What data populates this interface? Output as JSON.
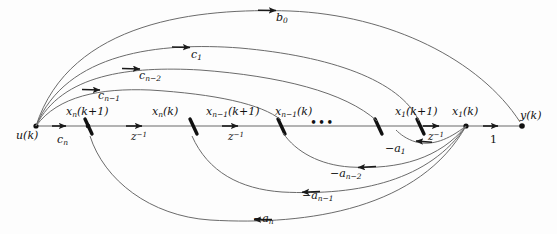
{
  "figure": {
    "type": "signal-flow-graph",
    "width": 557,
    "height": 234,
    "background_color": "#fdfdfd",
    "line_color": "#555555",
    "text_color": "#111111"
  },
  "nodes": [
    {
      "id": "u",
      "label": "u(k)",
      "x": 36,
      "y": 126,
      "label_x": 16,
      "label_y": 130,
      "kind": "input-node"
    },
    {
      "id": "xn_kp1",
      "label": "x<sub>n</sub>(k+1)",
      "x": 88,
      "y": 126,
      "label_x": 66,
      "label_y": 106,
      "kind": "state-node"
    },
    {
      "id": "xn_k",
      "label": "x<sub>n</sub>(k)",
      "x": 193,
      "y": 126,
      "label_x": 152,
      "label_y": 106,
      "kind": "state-node"
    },
    {
      "id": "xnm1_kp1",
      "label": "x<sub>n−1</sub>(k+1)",
      "x": 281,
      "y": 126,
      "label_x": 206,
      "label_y": 106,
      "kind": "state-node"
    },
    {
      "id": "xnm1_k",
      "label": "x<sub>n−1</sub>(k)",
      "x": 378,
      "y": 126,
      "label_x": 275,
      "label_y": 106,
      "kind": "state-node"
    },
    {
      "id": "x1_kp1",
      "label": "x<sub>1</sub>(k+1)",
      "x": 420,
      "y": 126,
      "label_x": 395,
      "label_y": 106,
      "kind": "state-node"
    },
    {
      "id": "x1_k",
      "label": "x<sub>1</sub>(k)",
      "x": 466,
      "y": 126,
      "label_x": 452,
      "label_y": 106,
      "kind": "state-node"
    },
    {
      "id": "y",
      "label": "y(k)",
      "x": 522,
      "y": 126,
      "label_x": 520,
      "label_y": 110,
      "kind": "output-node"
    }
  ],
  "ellipsis": {
    "text": "•••",
    "x": 310,
    "y": 116
  },
  "forward_path_gains": [
    {
      "id": "cn",
      "label": "c<sub>n</sub>",
      "x": 57,
      "y": 134
    },
    {
      "id": "z1",
      "label": "z<sup>−1</sup>",
      "x": 131,
      "y": 131
    },
    {
      "id": "z2",
      "label": "z<sup>−1</sup>",
      "x": 228,
      "y": 131
    },
    {
      "id": "z3",
      "label": "z<sup>−1</sup>",
      "x": 428,
      "y": 131
    },
    {
      "id": "one",
      "label": "1",
      "x": 490,
      "y": 134,
      "upright": true
    }
  ],
  "feedforward_branches": [
    {
      "id": "b0",
      "label": "b<sub>0</sub>",
      "label_x": 276,
      "label_y": 12,
      "from": "u",
      "to": "y"
    },
    {
      "id": "c1",
      "label": "c<sub>1</sub>",
      "label_x": 191,
      "label_y": 49,
      "from": "u",
      "to": "x1_kp1"
    },
    {
      "id": "cnm2",
      "label": "c<sub>n−2</sub>",
      "label_x": 139,
      "label_y": 70,
      "from": "u",
      "to": "xnm1_k"
    },
    {
      "id": "cnm1",
      "label": "c<sub>n−1</sub>",
      "label_x": 98,
      "label_y": 90,
      "from": "u",
      "to": "xnm1_kp1"
    }
  ],
  "feedback_branches": [
    {
      "id": "a1",
      "label": "−a<sub>1</sub>",
      "label_x": 385,
      "label_y": 143,
      "from": "x1_k",
      "to": "x1_kp1"
    },
    {
      "id": "anm2",
      "label": "−a<sub>n−2</sub>",
      "label_x": 330,
      "label_y": 168,
      "from": "x1_k",
      "to": "xnm1_k"
    },
    {
      "id": "anm1",
      "label": "−a<sub>n−1</sub>",
      "label_x": 302,
      "label_y": 190,
      "from": "x1_k",
      "to": "xnm1_kp1"
    },
    {
      "id": "an",
      "label": "−a<sub>n</sub>",
      "label_x": 253,
      "label_y": 213,
      "from": "x1_k",
      "to": "xn_kp1"
    }
  ]
}
